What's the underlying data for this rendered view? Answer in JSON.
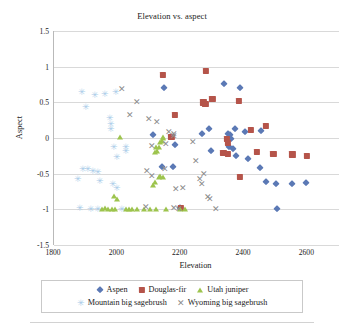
{
  "chart_data": {
    "type": "scatter",
    "title": "Elevation vs. aspect",
    "xlabel": "Elevation",
    "ylabel": "Aspect",
    "xlim": [
      1800,
      2700
    ],
    "ylim": [
      -1.5,
      1.5
    ],
    "xticks": [
      1800,
      2000,
      2200,
      2400,
      2600
    ],
    "yticks": [
      1.5,
      1,
      0.5,
      0,
      -0.5,
      -1,
      -1.5
    ],
    "ytick_labels": [
      "1.5",
      "1",
      "0.5",
      "0",
      "-0.5",
      "-1",
      "-1.5"
    ],
    "xtick_labels": [
      "1800",
      "2000",
      "2200",
      "2400",
      "2600"
    ],
    "grid": "horizontal",
    "legend_position": "bottom",
    "series": [
      {
        "name": "Aspen",
        "marker": "diamond",
        "color": "#5b79b5",
        "points": [
          [
            2148,
            0.7
          ],
          [
            2337,
            0.76
          ],
          [
            2387,
            0.7
          ],
          [
            2112,
            0.04
          ],
          [
            2182,
            -0.1
          ],
          [
            2268,
            0.06
          ],
          [
            2290,
            0.12
          ],
          [
            2349,
            0.06
          ],
          [
            2357,
            0.04
          ],
          [
            2360,
            -0.02
          ],
          [
            2371,
            0.12
          ],
          [
            2404,
            0.08
          ],
          [
            2455,
            0.1
          ],
          [
            2297,
            -0.18
          ],
          [
            2353,
            -0.13
          ],
          [
            2364,
            -0.16
          ],
          [
            2374,
            -0.25
          ],
          [
            2412,
            -0.3
          ],
          [
            2452,
            -0.42
          ],
          [
            2175,
            -0.4
          ],
          [
            2468,
            -0.62
          ],
          [
            2502,
            -0.65
          ],
          [
            2553,
            -0.65
          ],
          [
            2597,
            -0.63
          ],
          [
            2503,
            -0.99
          ],
          [
            2199,
            -0.98
          ],
          [
            2141,
            -0.41
          ]
        ]
      },
      {
        "name": "Douglas-fir",
        "marker": "square",
        "color": "#b5544a",
        "points": [
          [
            2144,
            0.88
          ],
          [
            2280,
            0.94
          ],
          [
            2300,
            0.55
          ],
          [
            2272,
            0.5
          ],
          [
            2278,
            0.48
          ],
          [
            2384,
            0.52
          ],
          [
            2182,
            0.32
          ],
          [
            2171,
            0.02
          ],
          [
            2421,
            0.11
          ],
          [
            2470,
            0.17
          ],
          [
            2345,
            -0.01
          ],
          [
            2350,
            -0.07
          ],
          [
            2348,
            -0.22
          ],
          [
            2441,
            -0.2
          ],
          [
            2493,
            -0.22
          ],
          [
            2553,
            -0.23
          ],
          [
            2598,
            -0.25
          ],
          [
            2386,
            -0.55
          ],
          [
            2200,
            -0.98
          ],
          [
            2335,
            -0.21
          ]
        ]
      },
      {
        "name": "Utah juniper",
        "marker": "triangle",
        "color": "#9dc44d",
        "points": [
          [
            2007,
            0.01
          ],
          [
            2143,
            0.01
          ],
          [
            2136,
            -0.06
          ],
          [
            2130,
            -0.12
          ],
          [
            2126,
            -0.18
          ],
          [
            2122,
            -0.13
          ],
          [
            2118,
            -0.2
          ],
          [
            2140,
            -0.04
          ],
          [
            2144,
            0.0
          ],
          [
            2130,
            -0.55
          ],
          [
            2136,
            -0.53
          ],
          [
            2144,
            -0.55
          ],
          [
            2118,
            -0.62
          ],
          [
            2112,
            -0.66
          ],
          [
            1990,
            -0.82
          ],
          [
            1998,
            -0.86
          ],
          [
            1961,
            -0.98
          ],
          [
            1972,
            -0.99
          ],
          [
            1982,
            -0.99
          ],
          [
            1993,
            -0.99
          ],
          [
            2028,
            -1.0
          ],
          [
            2046,
            -1.0
          ],
          [
            2063,
            -0.99
          ],
          [
            2083,
            -1.0
          ],
          [
            2103,
            -1.0
          ],
          [
            2122,
            -1.0
          ],
          [
            2155,
            -1.0
          ],
          [
            2199,
            -0.99
          ],
          [
            2214,
            -1.0
          ],
          [
            1950,
            -1.0
          ],
          [
            2036,
            -1.0
          ]
        ]
      },
      {
        "name": "Mountain big sagebrush",
        "marker": "star",
        "color": "#a8cbe8",
        "points": [
          [
            1888,
            0.64
          ],
          [
            1930,
            0.6
          ],
          [
            1960,
            0.62
          ],
          [
            1995,
            0.64
          ],
          [
            1900,
            0.44
          ],
          [
            1978,
            0.28
          ],
          [
            1980,
            0.2
          ],
          [
            1981,
            0.13
          ],
          [
            2028,
            -0.12
          ],
          [
            2026,
            -0.18
          ],
          [
            2000,
            -0.26
          ],
          [
            1890,
            -0.44
          ],
          [
            1908,
            -0.44
          ],
          [
            1922,
            -0.46
          ],
          [
            1938,
            -0.47
          ],
          [
            1875,
            -0.58
          ],
          [
            1946,
            -0.6
          ],
          [
            1985,
            -0.64
          ],
          [
            1998,
            -0.7
          ],
          [
            1882,
            -0.98
          ],
          [
            1918,
            -0.99
          ],
          [
            1940,
            -0.99
          ],
          [
            2015,
            -0.99
          ],
          [
            1990,
            -0.13
          ]
        ]
      },
      {
        "name": "Wyoming big sagebrush",
        "marker": "x",
        "color": "#8c8c8c",
        "points": [
          [
            2016,
            0.68
          ],
          [
            2062,
            0.5
          ],
          [
            2041,
            0.32
          ],
          [
            2099,
            0.26
          ],
          [
            2126,
            0.22
          ],
          [
            2163,
            0.09
          ],
          [
            2178,
            0.06
          ],
          [
            2155,
            -0.08
          ],
          [
            2110,
            -0.11
          ],
          [
            2180,
            0.03
          ],
          [
            2093,
            -0.46
          ],
          [
            2109,
            -0.53
          ],
          [
            2151,
            -0.44
          ],
          [
            2184,
            -0.72
          ],
          [
            2208,
            -0.7
          ],
          [
            2262,
            -0.58
          ],
          [
            2268,
            -0.64
          ],
          [
            2274,
            -0.51
          ],
          [
            2178,
            -0.98
          ],
          [
            2196,
            -0.99
          ],
          [
            2286,
            -0.83
          ],
          [
            2293,
            -0.86
          ],
          [
            2310,
            -0.99
          ],
          [
            2092,
            -0.97
          ],
          [
            2238,
            -0.06
          ],
          [
            2247,
            -0.32
          ]
        ]
      }
    ]
  },
  "legend": {
    "rows": [
      [
        {
          "label": "Aspen",
          "marker": "diamond"
        },
        {
          "label": "Douglas-fir",
          "marker": "square"
        },
        {
          "label": "Utah juniper",
          "marker": "triangle"
        }
      ],
      [
        {
          "label": "Mountain big sagebrush",
          "marker": "star"
        },
        {
          "label": "Wyoming big sagebrush",
          "marker": "x"
        }
      ]
    ]
  }
}
